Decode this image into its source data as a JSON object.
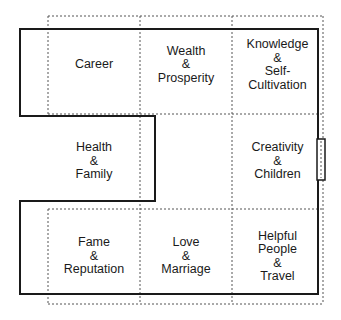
{
  "diagram": {
    "title": "",
    "colors": {
      "solid_line": "#1a1a1a",
      "dotted_line": "#555555",
      "text": "#1a1a1a"
    },
    "areas": [
      {
        "id": "career",
        "lines": [
          "Career"
        ]
      },
      {
        "id": "wealth",
        "lines": [
          "Wealth",
          "&",
          "Prosperity"
        ]
      },
      {
        "id": "knowledge",
        "lines": [
          "Knowledge",
          "&",
          "Self-",
          "Cultivation"
        ]
      },
      {
        "id": "health",
        "lines": [
          "Health",
          "&",
          "Family"
        ]
      },
      {
        "id": "center",
        "lines": []
      },
      {
        "id": "creativity",
        "lines": [
          "Creativity",
          "&",
          "Children"
        ]
      },
      {
        "id": "fame",
        "lines": [
          "Fame",
          "&",
          "Reputation"
        ]
      },
      {
        "id": "love",
        "lines": [
          "Love",
          "&",
          "Marriage"
        ]
      },
      {
        "id": "helpful",
        "lines": [
          "Helpful",
          "People",
          "&",
          "Travel"
        ]
      }
    ]
  }
}
